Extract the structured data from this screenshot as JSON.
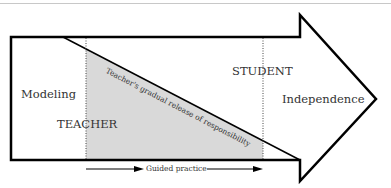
{
  "diagram": {
    "type": "gradual-release-of-responsibility",
    "labels": {
      "modeling": "Modeling",
      "teacher": "TEACHER",
      "student": "STUDENT",
      "independence": "Independence",
      "diagonal": "Teacher's gradual release of responsibility",
      "guided_practice": "Guided practice"
    },
    "colors": {
      "stroke": "#000000",
      "fill_shaded": "#d9d9d9",
      "text": "#333333",
      "top_rule": "#c8c8c8"
    }
  }
}
